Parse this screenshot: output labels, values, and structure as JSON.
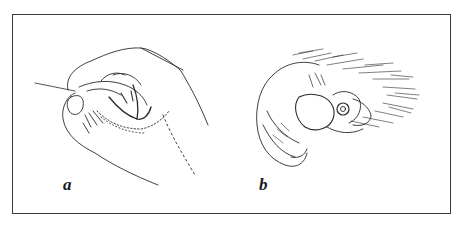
{
  "figure": {
    "panels": [
      {
        "id": "a",
        "label": "a",
        "subject": "human-hand-precision-grip-illustration"
      },
      {
        "id": "b",
        "label": "b",
        "subject": "primate-hand-grip-illustration"
      }
    ],
    "colors": {
      "ink": "#1a1a1a",
      "border": "#3a3a3a",
      "background": "#ffffff"
    }
  }
}
